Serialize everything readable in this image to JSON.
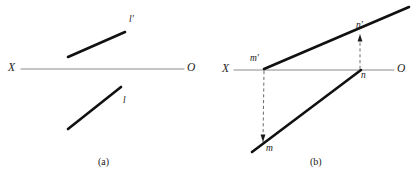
{
  "figure": {
    "background_color": "#ffffff",
    "axis_color": "#8a8a8a",
    "line_color": "#111111",
    "dash_color": "#5a5a5a",
    "text_color": "#1a1a1a",
    "width": 416,
    "height": 176
  },
  "panel_a": {
    "caption": "(a)",
    "axis": {
      "left_label": "X",
      "right_label": "O",
      "x1": 21,
      "y1": 69,
      "x2": 184,
      "y2": 69
    },
    "segments": [
      {
        "name": "l-prime",
        "label": "l'",
        "x1": 68,
        "y1": 57,
        "x2": 125,
        "y2": 32
      },
      {
        "name": "l",
        "label": "l",
        "x1": 68,
        "y1": 129,
        "x2": 121,
        "y2": 87
      }
    ],
    "labels": {
      "l_prime": "l'",
      "l": "l",
      "X": "X",
      "O": "O"
    }
  },
  "panel_b": {
    "caption": "(b)",
    "axis": {
      "left_label": "X",
      "right_label": "O",
      "x1": 234,
      "y1": 70,
      "x2": 394,
      "y2": 70
    },
    "segments": [
      {
        "name": "m-prime-n-prime",
        "x1": 264,
        "y1": 69,
        "x2": 409,
        "y2": 7
      },
      {
        "name": "m-n",
        "x1": 252,
        "y1": 152,
        "x2": 361,
        "y2": 70
      }
    ],
    "projectors": [
      {
        "name": "m-prime-to-m",
        "x1": 264,
        "y1": 71,
        "x2": 263,
        "y2": 142,
        "arrow": "down"
      },
      {
        "name": "n-to-n-prime",
        "x1": 360,
        "y1": 69,
        "x2": 360,
        "y2": 34,
        "arrow": "up"
      }
    ],
    "labels": {
      "m_prime": "m'",
      "m": "m",
      "n_prime": "n'",
      "n": "n",
      "X": "X",
      "O": "O"
    }
  }
}
